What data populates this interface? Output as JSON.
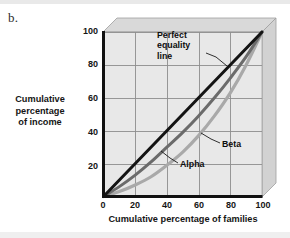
{
  "figure": {
    "panel_label": "b.",
    "background": "#ffffff"
  },
  "chart_data": {
    "type": "line",
    "title": "",
    "xlabel": "Cumulative percentage of families",
    "ylabel": "Cumulative percentage of income",
    "xlim": [
      0,
      100
    ],
    "ylim": [
      0,
      100
    ],
    "xticks": [
      "0",
      "20",
      "40",
      "60",
      "80",
      "100"
    ],
    "yticks": [
      "20",
      "40",
      "60",
      "80",
      "100"
    ],
    "grid": true,
    "legend_position": "inline-annotations",
    "annotations": [
      {
        "name": "perfect-equality-line",
        "text": "Perfect equality line",
        "lines": [
          "Perfect",
          "equality",
          "line"
        ]
      },
      {
        "name": "beta-label",
        "text": "Beta"
      },
      {
        "name": "alpha-label",
        "text": "Alpha"
      }
    ],
    "series": [
      {
        "name": "Perfect equality line",
        "color": "#141414",
        "x": [
          0,
          20,
          40,
          60,
          80,
          100
        ],
        "values": [
          0,
          20,
          40,
          60,
          80,
          100
        ]
      },
      {
        "name": "Alpha",
        "color": "#6b6b6b",
        "x": [
          0,
          10,
          20,
          30,
          40,
          50,
          60,
          70,
          80,
          90,
          100
        ],
        "values": [
          0,
          6,
          13,
          21,
          30,
          39,
          49,
          60,
          72,
          85,
          100
        ]
      },
      {
        "name": "Beta",
        "color": "#a9a9a9",
        "x": [
          0,
          10,
          20,
          30,
          40,
          50,
          60,
          70,
          80,
          90,
          100
        ],
        "values": [
          0,
          3,
          7,
          12,
          19,
          27,
          37,
          49,
          63,
          80,
          100
        ]
      }
    ]
  },
  "colors": {
    "plot_fill": "#e8e8e8",
    "grid": "#8e8e8e",
    "axis": "#111111",
    "bevel_top": "#d9d9d9",
    "bevel_side": "#d2d2d2",
    "bevel_edge": "#9a9a9a"
  }
}
